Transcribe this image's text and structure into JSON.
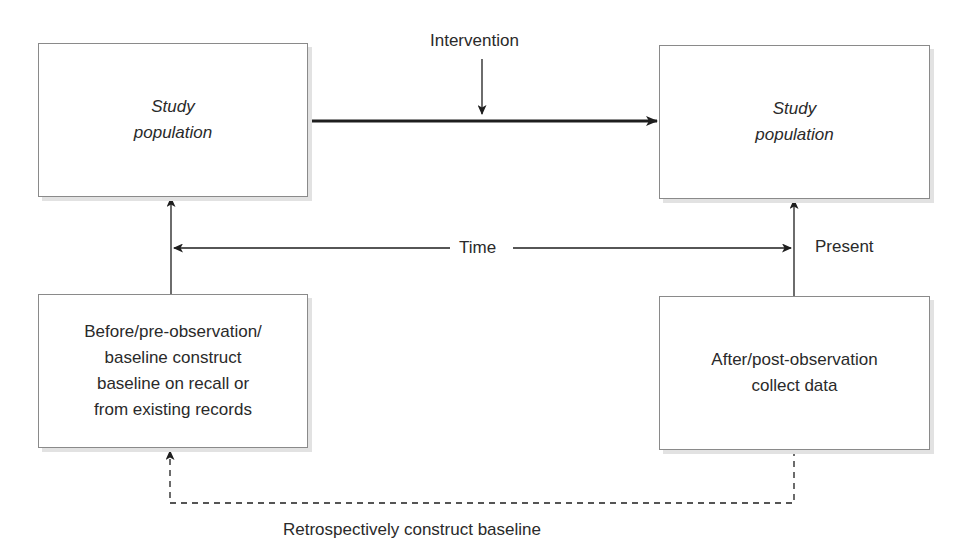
{
  "diagram": {
    "boxes": {
      "top_left": {
        "line1": "Study",
        "line2": "population"
      },
      "top_right": {
        "line1": "Study",
        "line2": "population"
      },
      "bottom_left": {
        "line1": "Before/pre-observation/",
        "line2": "baseline construct",
        "line3": "baseline on recall or",
        "line4": "from existing records"
      },
      "bottom_right": {
        "line1": "After/post-observation",
        "line2": "collect data"
      }
    },
    "labels": {
      "intervention": "Intervention",
      "time": "Time",
      "present": "Present",
      "retrospective": "Retrospectively construct baseline"
    },
    "colors": {
      "line": "#1e1e1e",
      "border": "#8a8a8a",
      "shadow": "#e2e2e2"
    }
  }
}
